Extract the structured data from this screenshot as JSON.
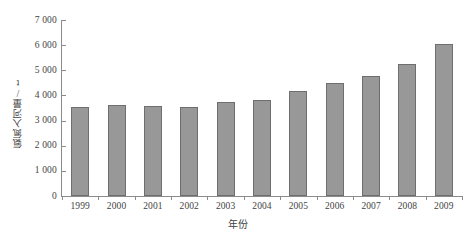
{
  "chart_data": {
    "type": "bar",
    "title": "",
    "subtitle": "",
    "xlabel": "年份",
    "ylabel": "氨氮入河量/t",
    "categories": [
      "1999",
      "2000",
      "2001",
      "2002",
      "2003",
      "2004",
      "2005",
      "2006",
      "2007",
      "2008",
      "2009"
    ],
    "values": [
      3550,
      3630,
      3580,
      3550,
      3720,
      3830,
      4160,
      4480,
      4780,
      5250,
      6050
    ],
    "series": [
      {
        "name": "氨氮入河量",
        "values": [
          3550,
          3630,
          3580,
          3550,
          3720,
          3830,
          4160,
          4480,
          4780,
          5250,
          6050
        ]
      }
    ],
    "ylim": [
      0,
      7000
    ],
    "ytick_values": [
      0,
      1000,
      2000,
      3000,
      4000,
      5000,
      6000,
      7000
    ],
    "ytick_labels": [
      "0",
      "1 000",
      "2 000",
      "3 000",
      "4 000",
      "5 000",
      "6 000",
      "7 000"
    ],
    "grid": false,
    "legend": false,
    "legend_position": "none",
    "bar_color": "#989898",
    "bar_border_color": "#6e6e6e",
    "axis_color": "#8b8b8b",
    "background_color": "#ffffff",
    "text_color": "#3f3f3f"
  }
}
